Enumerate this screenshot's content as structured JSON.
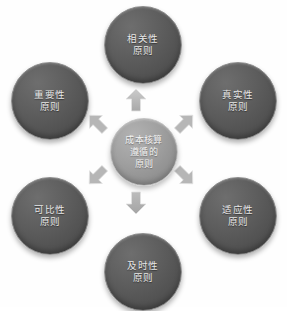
{
  "diagram": {
    "type": "radial-hub-and-spoke",
    "background_color": "#fefefe",
    "center": {
      "id": "center",
      "label": "成本核算\n遵循的\n原则",
      "lines": [
        "成本核算",
        "遵循的",
        "原则"
      ],
      "fill_color": "#9a9a9a",
      "text_color": "#f2f2f2",
      "diameter_px": 68
    },
    "node_fill_color": "#5a5a5a",
    "node_text_color": "#e8e8e8",
    "node_rim_color": "#8d8d8d",
    "arrow_color": "#b9b9b9",
    "nodes": [
      {
        "id": "node-top",
        "position": "top",
        "label": "相关性\n原则",
        "lines": [
          "相关性",
          "原则"
        ]
      },
      {
        "id": "node-top-right",
        "position": "top-right",
        "label": "真实性\n原则",
        "lines": [
          "真实性",
          "原则"
        ]
      },
      {
        "id": "node-bottom-right",
        "position": "bottom-right",
        "label": "适应性\n原则",
        "lines": [
          "适应性",
          "原则"
        ]
      },
      {
        "id": "node-bottom",
        "position": "bottom",
        "label": "及时性\n原则",
        "lines": [
          "及时性",
          "原则"
        ]
      },
      {
        "id": "node-bottom-left",
        "position": "bottom-left",
        "label": "可比性\n原则",
        "lines": [
          "可比性",
          "原则"
        ]
      },
      {
        "id": "node-top-left",
        "position": "top-left",
        "label": "重要性\n原则",
        "lines": [
          "重要性",
          "原则"
        ]
      }
    ],
    "arrows": [
      {
        "id": "arrow-up",
        "direction": "up",
        "icon": "arrow-up-icon"
      },
      {
        "id": "arrow-up-right",
        "direction": "up-right",
        "icon": "arrow-up-right-icon"
      },
      {
        "id": "arrow-down-right",
        "direction": "down-right",
        "icon": "arrow-down-right-icon"
      },
      {
        "id": "arrow-down",
        "direction": "down",
        "icon": "arrow-down-icon"
      },
      {
        "id": "arrow-down-left",
        "direction": "down-left",
        "icon": "arrow-down-left-icon"
      },
      {
        "id": "arrow-up-left",
        "direction": "up-left",
        "icon": "arrow-up-left-icon"
      }
    ]
  }
}
